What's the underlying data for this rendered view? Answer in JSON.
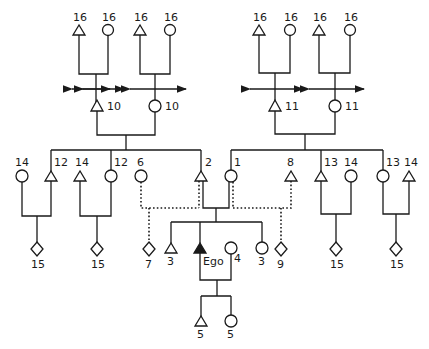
{
  "diagram": {
    "type": "kinship-chart",
    "colors": {
      "line": "#1a1a1a",
      "background": "#ffffff",
      "ego_fill": "#1a1a1a"
    },
    "legend_shapes": {
      "triangle": "male",
      "circle": "female",
      "diamond": "unspecified sex",
      "filled_triangle": "ego"
    },
    "nodes": {
      "gg_l1_m": {
        "label": "16",
        "shape": "triangle"
      },
      "gg_l1_f": {
        "label": "16",
        "shape": "circle"
      },
      "gg_l2_m": {
        "label": "16",
        "shape": "triangle"
      },
      "gg_l2_f": {
        "label": "16",
        "shape": "circle"
      },
      "gg_r1_m": {
        "label": "16",
        "shape": "triangle"
      },
      "gg_r1_f": {
        "label": "16",
        "shape": "circle"
      },
      "gg_r2_m": {
        "label": "16",
        "shape": "triangle"
      },
      "gg_r2_f": {
        "label": "16",
        "shape": "circle"
      },
      "gp_l_m": {
        "label": "10",
        "shape": "triangle"
      },
      "gp_l_f": {
        "label": "10",
        "shape": "circle"
      },
      "gp_r_m": {
        "label": "11",
        "shape": "triangle"
      },
      "gp_r_f": {
        "label": "11",
        "shape": "circle"
      },
      "p_l1_sp": {
        "label": "14",
        "shape": "circle"
      },
      "p_l1": {
        "label": "12",
        "shape": "triangle"
      },
      "p_l2_sp": {
        "label": "14",
        "shape": "triangle"
      },
      "p_l2": {
        "label": "12",
        "shape": "circle"
      },
      "p_6": {
        "label": "6",
        "shape": "circle"
      },
      "father": {
        "label": "2",
        "shape": "triangle"
      },
      "mother": {
        "label": "1",
        "shape": "circle"
      },
      "p_8": {
        "label": "8",
        "shape": "triangle"
      },
      "p_r1": {
        "label": "13",
        "shape": "triangle"
      },
      "p_r1_sp": {
        "label": "14",
        "shape": "circle"
      },
      "p_r2": {
        "label": "13",
        "shape": "circle"
      },
      "p_r2_sp": {
        "label": "14",
        "shape": "triangle"
      },
      "c_l1": {
        "label": "15",
        "shape": "diamond"
      },
      "c_l2": {
        "label": "15",
        "shape": "diamond"
      },
      "half_7": {
        "label": "7",
        "shape": "diamond"
      },
      "sib_b": {
        "label": "3",
        "shape": "triangle"
      },
      "ego": {
        "label": "Ego",
        "shape": "filled-triangle"
      },
      "wife": {
        "label": "4",
        "shape": "circle"
      },
      "sib_s": {
        "label": "3",
        "shape": "circle"
      },
      "half_9": {
        "label": "9",
        "shape": "diamond"
      },
      "c_r1": {
        "label": "15",
        "shape": "diamond"
      },
      "c_r2": {
        "label": "15",
        "shape": "diamond"
      },
      "son": {
        "label": "5",
        "shape": "triangle"
      },
      "daughter": {
        "label": "5",
        "shape": "circle"
      }
    }
  }
}
